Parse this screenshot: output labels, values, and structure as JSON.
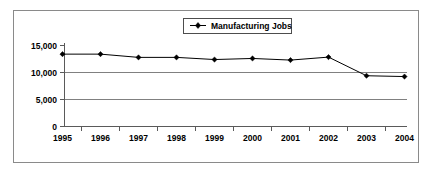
{
  "chart_data": {
    "type": "line",
    "title": "",
    "xlabel": "",
    "ylabel": "",
    "categories": [
      "1995",
      "1996",
      "1997",
      "1998",
      "1999",
      "2000",
      "2001",
      "2002",
      "2003",
      "2004"
    ],
    "series": [
      {
        "name": "Manufacturing Jobs",
        "values": [
          13400,
          13400,
          12800,
          12800,
          12400,
          12600,
          12300,
          12850,
          9400,
          9250
        ],
        "marker": "diamond",
        "color": "#000000"
      }
    ],
    "ylim": [
      0,
      15000
    ],
    "yticks": [
      0,
      5000,
      10000,
      15000
    ],
    "ytick_labels": [
      "0",
      "5,000",
      "10,000",
      "15,000"
    ],
    "gridlines_at": [
      5000,
      10000
    ],
    "grid": true,
    "legend_position": "top-center",
    "legend_entries": [
      "Manufacturing Jobs"
    ]
  },
  "legend": {
    "label": "Manufacturing Jobs"
  },
  "axes": {
    "y_labels": [
      "15,000",
      "10,000",
      "5,000",
      "0"
    ],
    "x_labels": [
      "1995",
      "1996",
      "1997",
      "1998",
      "1999",
      "2000",
      "2001",
      "2002",
      "2003",
      "2004"
    ]
  }
}
